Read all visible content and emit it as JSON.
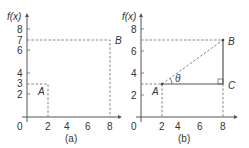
{
  "panels": [
    {
      "caption": "(a)",
      "y_label": "f(x)",
      "origin_label": "0",
      "x_ticks": [
        "2",
        "4",
        "6",
        "8"
      ],
      "y_ticks": [
        "8",
        "7",
        "6",
        "4",
        "3",
        "2"
      ],
      "points": [
        {
          "name": "A",
          "x": 2,
          "y": 3
        },
        {
          "name": "B",
          "x": 8,
          "y": 7
        }
      ]
    },
    {
      "caption": "(b)",
      "y_label": "f(x)",
      "origin_label": "0",
      "x_ticks": [
        "2",
        "4",
        "6",
        "8"
      ],
      "y_ticks": [
        "8",
        "6",
        "4",
        "2"
      ],
      "points": [
        {
          "name": "A",
          "x": 2,
          "y": 3
        },
        {
          "name": "B",
          "x": 8,
          "y": 7
        },
        {
          "name": "C",
          "x": 8,
          "y": 3
        }
      ],
      "angle_label": "θ"
    }
  ],
  "colors": {
    "axis": "#555555",
    "dashed": "#777777",
    "text": "#333333"
  }
}
